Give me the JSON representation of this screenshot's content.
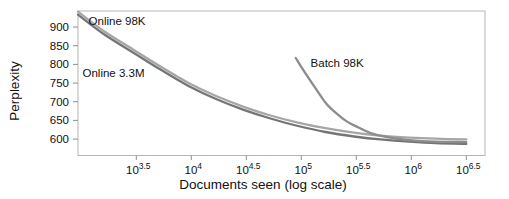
{
  "chart_data": {
    "type": "line",
    "xlabel": "Documents seen (log scale)",
    "ylabel": "Perplexity",
    "x_scale": "log10",
    "grid": false,
    "legend": "inline-annotations",
    "xlim": [
      2.97,
      6.67
    ],
    "ylim": [
      556,
      943
    ],
    "y_ticks": [
      900,
      850,
      800,
      750,
      700,
      650,
      600
    ],
    "x_ticks": [
      {
        "value": 3.5,
        "base": "10",
        "exp": "3.5"
      },
      {
        "value": 4.0,
        "base": "10",
        "exp": "4"
      },
      {
        "value": 4.5,
        "base": "10",
        "exp": "4.5"
      },
      {
        "value": 5.0,
        "base": "10",
        "exp": "5"
      },
      {
        "value": 5.5,
        "base": "10",
        "exp": "5.5"
      },
      {
        "value": 6.0,
        "base": "10",
        "exp": "6"
      },
      {
        "value": 6.5,
        "base": "10",
        "exp": "6.5"
      }
    ],
    "series": [
      {
        "name": "Online 3.3M",
        "color": "#757575",
        "log10_x": [
          2.97,
          3.21,
          3.47,
          3.72,
          3.97,
          4.22,
          4.47,
          4.72,
          4.97,
          5.22,
          5.48,
          5.72,
          5.98,
          6.22,
          6.5
        ],
        "perplexity": [
          933,
          880,
          832,
          786,
          743,
          708,
          679,
          655,
          635,
          619,
          607,
          599,
          593,
          589,
          587
        ]
      },
      {
        "name": "Online 98K",
        "color": "#a6a6a6",
        "log10_x": [
          2.97,
          3.21,
          3.47,
          3.72,
          3.97,
          4.22,
          4.47,
          4.72,
          4.97,
          5.22,
          5.48,
          5.72,
          5.98,
          6.22,
          6.5
        ],
        "perplexity": [
          941,
          888,
          840,
          794,
          751,
          716,
          687,
          663,
          644,
          629,
          617,
          609,
          604,
          601,
          599
        ]
      },
      {
        "name": "Batch 98K",
        "color": "#8c8c8c",
        "log10_x": [
          4.95,
          5.02,
          5.13,
          5.23,
          5.33,
          5.42,
          5.52,
          5.63,
          5.78,
          5.98,
          6.22,
          6.5
        ],
        "perplexity": [
          817,
          784,
          736,
          694,
          666,
          646,
          631,
          616,
          605,
          597,
          593,
          592
        ]
      }
    ],
    "annotations": [
      {
        "text": "Online 98K",
        "log10_x": 3.325,
        "perplexity": 916
      },
      {
        "text": "Online 3.3M",
        "log10_x": 3.293,
        "perplexity": 778
      },
      {
        "text": "Batch 98K",
        "log10_x": 5.326,
        "perplexity": 804
      }
    ],
    "style": {
      "background": "#ffffff",
      "frame": "#b5b5b5",
      "tick": "#8f8f8f",
      "text": "#111111"
    }
  }
}
